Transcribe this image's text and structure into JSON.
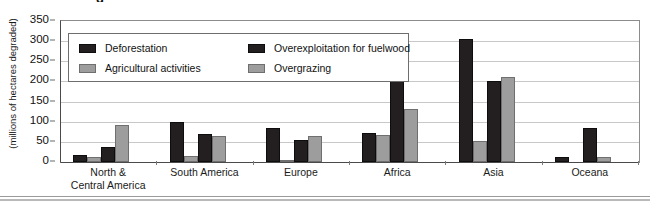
{
  "figure": {
    "title_fragment": "g",
    "ylabel": "(millions of hectares degraded)"
  },
  "chart_data": {
    "type": "bar",
    "title": "",
    "xlabel": "",
    "ylabel": "(millions of hectares degraded)",
    "ylim": [
      0,
      350
    ],
    "yticks": [
      0,
      50,
      100,
      150,
      200,
      250,
      300,
      350
    ],
    "grid": true,
    "legend_position": "upper-left-inside",
    "categories": [
      "North &\nCentral America",
      "South America",
      "Europe",
      "Africa",
      "Asia",
      "Oceana"
    ],
    "category_lines": [
      [
        "North &",
        "Central America"
      ],
      [
        "South America"
      ],
      [
        "Europe"
      ],
      [
        "Africa"
      ],
      [
        "Asia"
      ],
      [
        "Oceana"
      ]
    ],
    "series": [
      {
        "name": "Deforestation",
        "color": "#231f20",
        "values": [
          18,
          100,
          85,
          72,
          305,
          12
        ]
      },
      {
        "name": "Agricultural activities",
        "color": "#9d9d9d",
        "values": [
          12,
          15,
          3,
          67,
          52,
          0
        ]
      },
      {
        "name": "Overexploitation for fuelwood",
        "color": "#231f20",
        "values": [
          38,
          70,
          55,
          248,
          200,
          85
        ]
      },
      {
        "name": "Overgrazing",
        "color": "#9d9d9d",
        "values": [
          92,
          65,
          65,
          132,
          210,
          12
        ]
      }
    ]
  },
  "legend": {
    "items": [
      {
        "label": "Deforestation",
        "swatch": "dark"
      },
      {
        "label": "Agricultural activities",
        "swatch": "light"
      },
      {
        "label": "Overexploitation for fuelwood",
        "swatch": "dark"
      },
      {
        "label": "Overgrazing",
        "swatch": "light"
      }
    ]
  }
}
